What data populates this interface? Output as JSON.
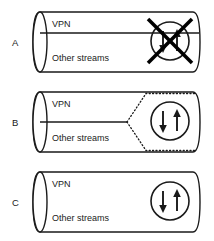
{
  "figure": {
    "background_color": "#ffffff",
    "stroke_color": "#1a1a1a",
    "type": "schematic-diagram",
    "panel_count": 3
  },
  "panels": [
    {
      "id": "A",
      "label": "A",
      "top_label": "VPN",
      "bottom_label": "Other streams",
      "has_divider": true,
      "divider_style": "solid-full",
      "has_dotted_wedge": false,
      "flow_indicator": "bidirectional-arrows-in-circle",
      "crossed_out": true,
      "cross_symbol": "x-mark"
    },
    {
      "id": "B",
      "label": "B",
      "top_label": "VPN",
      "bottom_label": "Other streams",
      "has_divider": true,
      "divider_style": "solid-partial-to-wedge-vertex",
      "has_dotted_wedge": true,
      "flow_indicator": "bidirectional-arrows-in-circle",
      "crossed_out": false,
      "cross_symbol": ""
    },
    {
      "id": "C",
      "label": "C",
      "top_label": "VPN",
      "bottom_label": "Other streams",
      "has_divider": false,
      "divider_style": "none",
      "has_dotted_wedge": false,
      "flow_indicator": "bidirectional-arrows-in-circle",
      "crossed_out": false,
      "cross_symbol": ""
    }
  ],
  "legend": {
    "arrow_down_meaning": "downstream-flow",
    "arrow_up_meaning": "upstream-flow"
  }
}
